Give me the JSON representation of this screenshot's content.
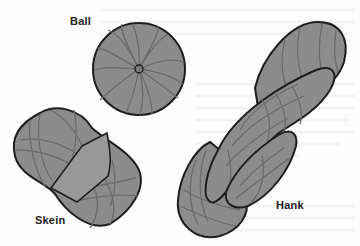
{
  "figure": {
    "labels": {
      "ball": "Ball",
      "skein": "Skein",
      "hank": "Hank"
    },
    "items": [
      {
        "name": "ball",
        "label": "Ball",
        "shape": "sphere with wound strands and center end"
      },
      {
        "name": "skein",
        "label": "Skein",
        "shape": "oblong wound yarn with paper band around middle"
      },
      {
        "name": "hank",
        "label": "Hank",
        "shape": "twisted loop of yarn"
      }
    ]
  },
  "colors": {
    "background": "#fdfdfd",
    "yarn_fill": "#8c8c8c",
    "band_fill": "#999999",
    "strand": "#6b6b6b",
    "outline": "#1e1e1e",
    "label": "#222222"
  }
}
